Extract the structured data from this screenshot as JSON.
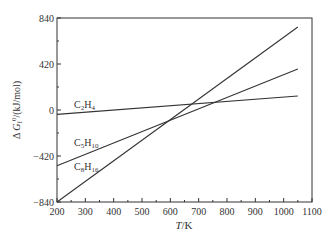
{
  "chart_data": {
    "type": "line",
    "title": "",
    "xlabel": "T/K",
    "ylabel": "Δ G_f°/(kJ/mol)",
    "xlim": [
      200,
      1100
    ],
    "ylim": [
      -840,
      840
    ],
    "xticks": [
      200,
      300,
      400,
      500,
      600,
      700,
      800,
      900,
      1000,
      1100
    ],
    "yticks": [
      -840,
      -420,
      0,
      420,
      840
    ],
    "grid": false,
    "legend": "inline labels",
    "series": [
      {
        "name": "C2H4",
        "label_main": "C",
        "sub1": "2",
        "mid": "H",
        "sub2": "4",
        "x": [
          200,
          1050
        ],
        "y": [
          -40,
          128
        ]
      },
      {
        "name": "C5H10",
        "label_main": "C",
        "sub1": "5",
        "mid": "H",
        "sub2": "10",
        "x": [
          200,
          1050
        ],
        "y": [
          -510,
          374
        ]
      },
      {
        "name": "C8H16",
        "label_main": "C",
        "sub1": "8",
        "mid": "H",
        "sub2": "16",
        "x": [
          200,
          1050
        ],
        "y": [
          -840,
          758
        ]
      }
    ]
  },
  "axis": {
    "x_label_italic": "T",
    "x_label_rest": "/K",
    "y_label_prefix": "Δ ",
    "y_label_italic": "G",
    "y_label_sub": "f",
    "y_label_sup": "0",
    "y_label_rest": "/(kJ/mol)"
  }
}
